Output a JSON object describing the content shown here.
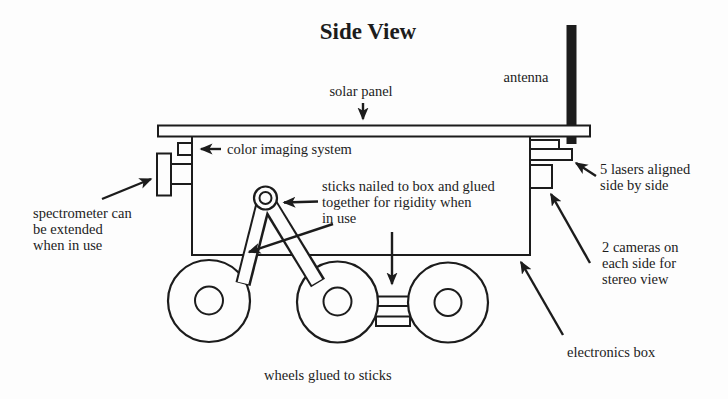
{
  "title": "Side View",
  "colors": {
    "ink": "#1c1c1c",
    "paper": "#fdfdfd"
  },
  "labels": {
    "solar_panel": "solar panel",
    "antenna": "antenna",
    "color_imaging_system": "color imaging system",
    "lasers": "5 lasers aligned\nside by side",
    "spectrometer": "spectrometer can\nbe extended\nwhen in use",
    "sticks": "sticks nailed to box and glued\ntogether for rigidity when\nin use",
    "cameras": "2 cameras on\neach side for\nstereo view",
    "electronics_box": "electronics box",
    "wheels": "wheels glued to sticks"
  }
}
